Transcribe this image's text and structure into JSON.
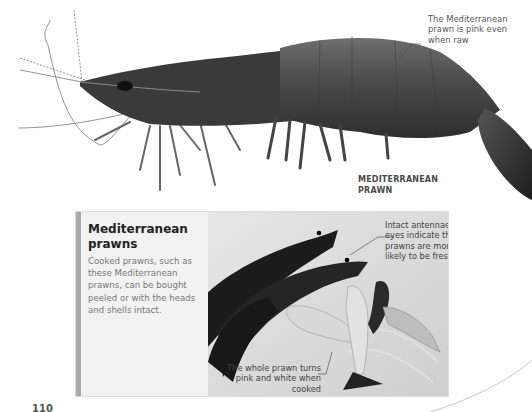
{
  "main": {
    "callout_pink": "The Mediterranean prawn is pink even when raw",
    "caption": [
      "MEDITERRANEAN",
      "PRAWN"
    ]
  },
  "info_box": {
    "title": "Mediterranean prawns",
    "body": "Cooked prawns, such as these Mediterranean prawns, can be bought peeled or with the heads and shells intact.",
    "callout_fresh": "Intact antennae and eyes indicate the prawns are more likely to be fresh",
    "callout_cooked": "The whole prawn turns pink and white when cooked"
  },
  "page": {
    "number": "110"
  },
  "colors": {
    "box_bg": "#f2f2f2",
    "box_border": "#a9a9a9",
    "title": "#222222",
    "body_text": "#777777"
  }
}
